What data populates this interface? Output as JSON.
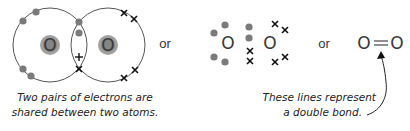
{
  "diagram": {
    "left": {
      "atom1": "O",
      "atom2": "O",
      "caption_line1": "Two pairs of electrons are",
      "caption_line2": "shared between two atoms."
    },
    "connector1": "or",
    "middle": {
      "atom1": "O",
      "atom2": "O"
    },
    "connector2": "or",
    "right": {
      "formula_atom1": "O",
      "formula_bond": "=",
      "formula_atom2": "O",
      "caption_line1": "These lines represent",
      "caption_line2": "a double bond."
    },
    "colors": {
      "electron_dot": "#7a7a7a",
      "nucleus_outer": "#9a9a9a",
      "nucleus_inner": "#7e7e7e",
      "shell_line": "#555555",
      "cross": "#111111"
    }
  }
}
